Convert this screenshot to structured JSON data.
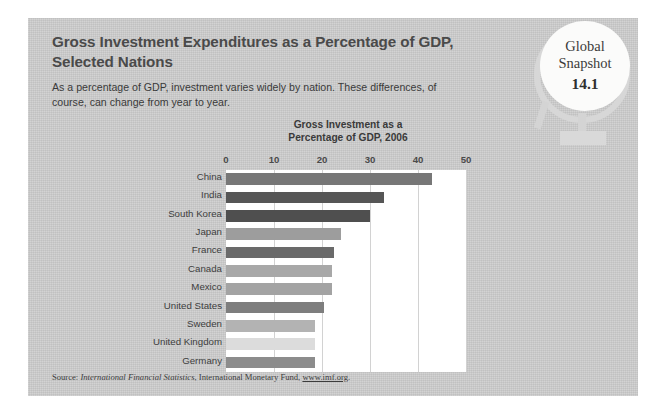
{
  "headline": "Gross Investment Expenditures as a Percentage of GDP, Selected Nations",
  "subhead": "As a percentage of GDP, investment varies widely by nation. These differences, of course, can change from year to year.",
  "badge": {
    "line1": "Global",
    "line2": "Snapshot",
    "number": "14.1",
    "icon": "globe-icon"
  },
  "source": {
    "prefix": "Source: ",
    "italic_title": "International Financial Statistics",
    "middle": ", International Monetary Fund, ",
    "url": "www.imf.org",
    "suffix": "."
  },
  "colors": {
    "panel": "#c9c9c9",
    "plot_background": "#ffffff",
    "gridline": "#d2d2d2",
    "text": "#3d3d3d",
    "heading": "#4a4a4a",
    "bar_dark": "#6e6e6e",
    "bar_darker": "#5a5a5a",
    "bar_mid": "#9a9a9a",
    "bar_light": "#bdbdbd",
    "bar_lighter": "#d6d6d6",
    "badge_disc": "#fbfbfa",
    "globe_stand": "#d7d7d7"
  },
  "chart_data": {
    "type": "bar",
    "orientation": "horizontal",
    "title": "Gross Investment as a Percentage of GDP, 2006",
    "title_lines": [
      "Gross Investment as a",
      "Percentage of GDP, 2006"
    ],
    "xlabel": "",
    "ylabel": "",
    "xlim": [
      0,
      50
    ],
    "ticks": [
      0,
      10,
      20,
      30,
      40,
      50
    ],
    "tick_labels": [
      "0",
      "10",
      "20",
      "30",
      "40",
      "50"
    ],
    "grid": true,
    "legend": "none",
    "categories": [
      "China",
      "India",
      "South Korea",
      "Japan",
      "France",
      "Canada",
      "Mexico",
      "United States",
      "Sweden",
      "United Kingdom",
      "Germany"
    ],
    "values": [
      43,
      33,
      30,
      24,
      22.5,
      22,
      22,
      20.5,
      18.5,
      18.5,
      18.5
    ],
    "bar_colors": [
      "#777777",
      "#565656",
      "#4f4f4f",
      "#9d9d9d",
      "#6a6a6a",
      "#a8a8a8",
      "#a3a3a3",
      "#7e7e7e",
      "#b3b3b3",
      "#dcdcdc",
      "#8c8c8c"
    ]
  }
}
